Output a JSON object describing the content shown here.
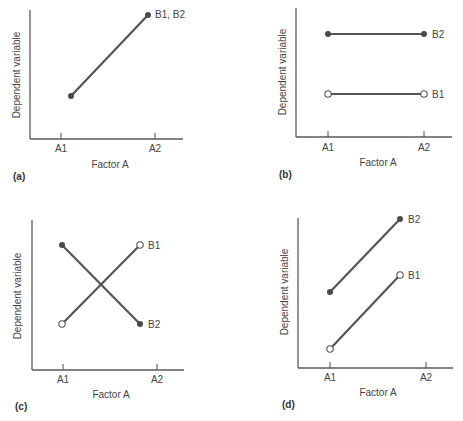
{
  "figure": {
    "panels": [
      "a",
      "b",
      "c",
      "d"
    ]
  },
  "chart_data": [
    {
      "id": "a",
      "type": "line",
      "panel_label": "(a)",
      "xlabel": "Factor A",
      "ylabel": "Dependent variable",
      "categories": [
        "A1",
        "A2"
      ],
      "series": [
        {
          "name": "B1, B2",
          "marker": "filled",
          "values": [
            0.35,
            0.95
          ],
          "x_offsets": [
            0.1,
            -0.07
          ]
        }
      ],
      "layout": {
        "origin": [
          30,
          139
        ],
        "y_top": 10,
        "x_end": 183,
        "ticks_x": [
          61,
          155
        ],
        "tick_label_y": 152,
        "xlabel_x": 110,
        "xlabel_y": 168,
        "ylabel_x": 20,
        "ylabel_y": 75,
        "panel_label_x": 13,
        "panel_label_y": 180,
        "series_px": [
          [
            [
              71,
              96
            ],
            [
              148,
              15
            ]
          ]
        ],
        "series_label_pos": [
          [
            155,
            18
          ]
        ]
      },
      "grid": false,
      "legend": "inline labels at line ends"
    },
    {
      "id": "b",
      "type": "line",
      "panel_label": "(b)",
      "xlabel": "Factor A",
      "ylabel": "Dependent variable",
      "categories": [
        "A1",
        "A2"
      ],
      "series": [
        {
          "name": "B2",
          "marker": "filled",
          "values": [
            0.8,
            0.8
          ]
        },
        {
          "name": "B1",
          "marker": "open",
          "values": [
            0.4,
            0.4
          ]
        }
      ],
      "layout": {
        "origin": [
          296,
          137
        ],
        "y_top": 8,
        "x_end": 452,
        "ticks_x": [
          328,
          424
        ],
        "tick_label_y": 151,
        "xlabel_x": 378,
        "xlabel_y": 166,
        "ylabel_x": 286,
        "ylabel_y": 72,
        "panel_label_x": 279,
        "panel_label_y": 178,
        "series_px": [
          [
            [
              328,
              34
            ],
            [
              424,
              34
            ]
          ],
          [
            [
              328,
              94
            ],
            [
              424,
              94
            ]
          ]
        ],
        "series_label_pos": [
          [
            432,
            38
          ],
          [
            432,
            98
          ]
        ]
      },
      "grid": false,
      "legend": "inline labels at line ends"
    },
    {
      "id": "c",
      "type": "line",
      "panel_label": "(c)",
      "xlabel": "Factor A",
      "ylabel": "Dependent variable",
      "categories": [
        "A1",
        "A2"
      ],
      "series": [
        {
          "name": "B1",
          "marker": "open",
          "values": [
            0.3,
            0.85
          ]
        },
        {
          "name": "B2",
          "marker": "filled",
          "values": [
            0.85,
            0.3
          ]
        }
      ],
      "layout": {
        "origin": [
          32,
          370
        ],
        "y_top": 220,
        "x_end": 184,
        "ticks_x": [
          63,
          157
        ],
        "tick_label_y": 383,
        "xlabel_x": 111,
        "xlabel_y": 398,
        "ylabel_x": 21,
        "ylabel_y": 296,
        "panel_label_x": 15,
        "panel_label_y": 410,
        "series_px": [
          [
            [
              62,
              324
            ],
            [
              140,
              245
            ]
          ],
          [
            [
              62,
              245
            ],
            [
              140,
              324
            ]
          ]
        ],
        "series_label_pos": [
          [
            148,
            249
          ],
          [
            148,
            328
          ]
        ]
      },
      "grid": false,
      "legend": "inline labels at line ends"
    },
    {
      "id": "d",
      "type": "line",
      "panel_label": "(d)",
      "xlabel": "Factor A",
      "ylabel": "Dependent variable",
      "categories": [
        "A1",
        "A2"
      ],
      "series": [
        {
          "name": "B2",
          "marker": "filled",
          "values": [
            0.5,
            0.95
          ]
        },
        {
          "name": "B1",
          "marker": "open",
          "values": [
            0.12,
            0.6
          ]
        }
      ],
      "layout": {
        "origin": [
          298,
          368
        ],
        "y_top": 218,
        "x_end": 453,
        "ticks_x": [
          330,
          426
        ],
        "tick_label_y": 381,
        "xlabel_x": 378,
        "xlabel_y": 396,
        "ylabel_x": 288,
        "ylabel_y": 292,
        "panel_label_x": 282,
        "panel_label_y": 408,
        "series_px": [
          [
            [
              330,
              292
            ],
            [
              400,
              219
            ]
          ],
          [
            [
              330,
              349
            ],
            [
              400,
              275
            ]
          ]
        ],
        "series_label_pos": [
          [
            408,
            223
          ],
          [
            408,
            279
          ]
        ]
      },
      "grid": false,
      "legend": "inline labels at line ends"
    }
  ],
  "colors": {
    "axis": "#5a5a5a",
    "line": "#555555",
    "marker_fill": "#4a4a4a",
    "marker_open_fill": "#ffffff",
    "text": "#444444"
  }
}
